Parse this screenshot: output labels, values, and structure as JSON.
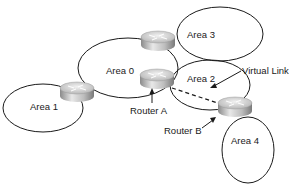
{
  "diagram": {
    "type": "ospf-area-topology",
    "areas": [
      {
        "id": "area0",
        "label": "Area 0"
      },
      {
        "id": "area1",
        "label": "Area 1"
      },
      {
        "id": "area2",
        "label": "Area 2"
      },
      {
        "id": "area3",
        "label": "Area 3"
      },
      {
        "id": "area4",
        "label": "Area 4"
      }
    ],
    "routers": [
      {
        "id": "r-area1",
        "label": ""
      },
      {
        "id": "r-area3",
        "label": ""
      },
      {
        "id": "router-a",
        "label": "Router A"
      },
      {
        "id": "router-b",
        "label": "Router B"
      }
    ],
    "annotations": {
      "virtual_link": "Virtual Link",
      "router_a": "Router A",
      "router_b": "Router B"
    },
    "links": [
      {
        "from": "router-a",
        "to": "router-b",
        "style": "dashed",
        "label": "Virtual Link"
      }
    ],
    "colors": {
      "line": "#1a1a1a",
      "router_top": "#d8d8d8",
      "router_side": "#a0a0a0"
    }
  }
}
